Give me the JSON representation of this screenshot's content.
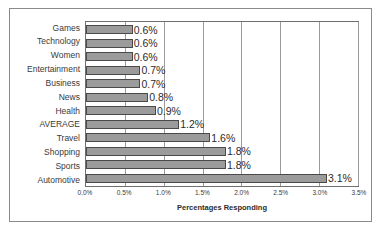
{
  "chart_data": {
    "type": "bar",
    "orientation": "horizontal",
    "title": "",
    "xlabel": "Percentages Responding",
    "ylabel": "",
    "xlim": [
      0,
      3.5
    ],
    "grid": true,
    "legend": false,
    "xticks": [
      "0.0%",
      "0.5%",
      "1.0%",
      "1.5%",
      "2.0%",
      "2.5%",
      "3.0%",
      "3.5%"
    ],
    "xtick_values": [
      0,
      0.5,
      1.0,
      1.5,
      2.0,
      2.5,
      3.0,
      3.5
    ],
    "categories": [
      "Games",
      "Technology",
      "Women",
      "Entertainment",
      "Business",
      "News",
      "Health",
      "AVERAGE",
      "Travel",
      "Shopping",
      "Sports",
      "Automotive"
    ],
    "values": [
      0.6,
      0.6,
      0.6,
      0.7,
      0.7,
      0.8,
      0.9,
      1.2,
      1.6,
      1.8,
      1.8,
      3.1
    ],
    "data_labels": [
      "0.6%",
      "0.6%",
      "0.6%",
      "0.7%",
      "0.7%",
      "0.8%",
      "0.9%",
      "1.2%",
      "1.6%",
      "1.8%",
      "1.8%",
      "3.1%"
    ],
    "colors": {
      "bar_fill": "#9b9b9b",
      "bar_border": "#4a4a4a",
      "gridline": "#9a9a9a",
      "plot_border": "#6f6f6f",
      "frame_border": "#8a8a8a",
      "text": "#3a3a3a",
      "background": "#ffffff"
    }
  }
}
